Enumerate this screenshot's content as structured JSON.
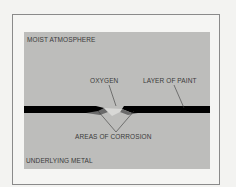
{
  "diagram": {
    "labels": {
      "top": "MOIST ATMOSPHERE",
      "oxygen": "OXYGEN",
      "paint": "LAYER OF PAINT",
      "corrosion": "AREAS OF CORROSION",
      "bottom": "UNDERLYING METAL"
    },
    "colors": {
      "panel": "#bdbdbb",
      "paint_layer": "#000000",
      "frame": "#8a8a8a",
      "text": "#3a3a3a"
    }
  }
}
